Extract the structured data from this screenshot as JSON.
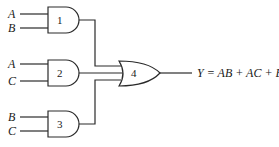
{
  "diagram": {
    "type": "logic-circuit",
    "gates": [
      {
        "id": "1",
        "type": "AND",
        "label": "1",
        "inputs": [
          "A",
          "B"
        ]
      },
      {
        "id": "2",
        "type": "AND",
        "label": "2",
        "inputs": [
          "A",
          "C"
        ]
      },
      {
        "id": "3",
        "type": "AND",
        "label": "3",
        "inputs": [
          "B",
          "C"
        ]
      },
      {
        "id": "4",
        "type": "OR",
        "label": "4",
        "inputs": [
          "1",
          "2",
          "3"
        ]
      }
    ],
    "inputs": {
      "g1": {
        "top": "A",
        "bottom": "B"
      },
      "g2": {
        "top": "A",
        "bottom": "C"
      },
      "g3": {
        "top": "B",
        "bottom": "C"
      }
    },
    "output": {
      "equation": "Y = AB + AC + BC"
    },
    "colors": {
      "line": "#2a2a2a",
      "text": "#1a1a1a",
      "background": "#ffffff"
    }
  }
}
